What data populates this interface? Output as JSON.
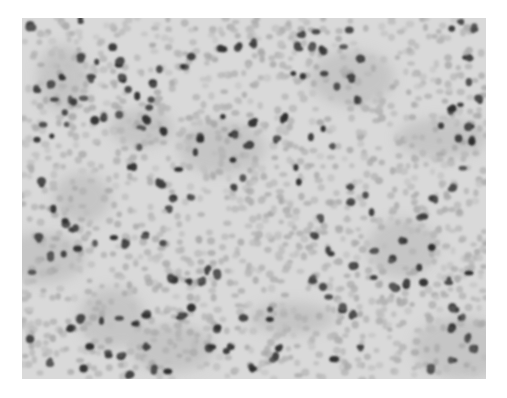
{
  "figure": {
    "caption": "",
    "palette": {
      "background": "#ffffff",
      "field": "#d6d6d6",
      "erythrocyte": "#bcbcbc",
      "leukocyte": "#3a3a3a"
    }
  }
}
